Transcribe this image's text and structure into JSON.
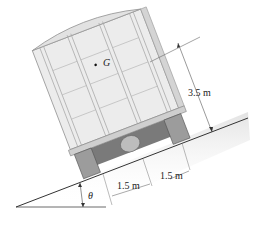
{
  "figure": {
    "center_of_gravity_label": "G",
    "height_dimension": "3.5 m",
    "wheel_offset_left": "1.5 m",
    "wheel_offset_right": "1.5 m",
    "angle_label": "θ"
  },
  "colors": {
    "body_fill": "#ececec",
    "body_stroke": "#9a9a9a",
    "chassis_dark": "#6e6e6e",
    "ground_line": "#333333",
    "ground_shade": "#e6e6e6",
    "dimension_line": "#555555"
  }
}
